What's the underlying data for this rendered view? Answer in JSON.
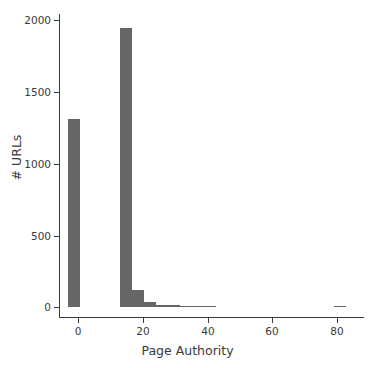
{
  "chart_data": {
    "type": "bar",
    "subtype": "histogram",
    "title": "",
    "subtitle": "",
    "xlabel": "Page Authority",
    "ylabel": "# URLs",
    "xlim": [
      -4,
      88
    ],
    "ylim": [
      0,
      2080
    ],
    "xticks": [
      0,
      20,
      40,
      60,
      80
    ],
    "xtick_labels": [
      "0",
      "20",
      "40",
      "60",
      "80"
    ],
    "yticks": [
      0,
      500,
      1000,
      1500,
      2000
    ],
    "ytick_labels": [
      "0",
      "500",
      "1000",
      "1500",
      "2000"
    ],
    "grid": false,
    "legend": null,
    "bar_color": "#666666",
    "axis_color": "#3a3a3a",
    "background_color": "#ffffff",
    "bins": [
      {
        "x0": -3.0,
        "x1": 0.7,
        "value": 1310
      },
      {
        "x0": 13.0,
        "x1": 16.7,
        "value": 1945
      },
      {
        "x0": 16.7,
        "x1": 20.4,
        "value": 120
      },
      {
        "x0": 20.4,
        "x1": 24.1,
        "value": 35
      },
      {
        "x0": 24.1,
        "x1": 27.8,
        "value": 14
      },
      {
        "x0": 27.8,
        "x1": 31.5,
        "value": 12
      },
      {
        "x0": 31.5,
        "x1": 35.2,
        "value": 5
      },
      {
        "x0": 35.2,
        "x1": 38.9,
        "value": 2
      },
      {
        "x0": 38.9,
        "x1": 42.6,
        "value": 1
      },
      {
        "x0": 79.0,
        "x1": 82.7,
        "value": 1
      }
    ]
  }
}
